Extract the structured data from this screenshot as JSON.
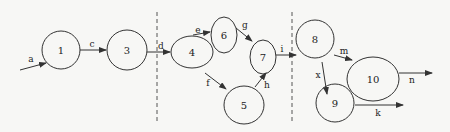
{
  "diagram": {
    "type": "directed-graph",
    "colors": {
      "stroke": "#333333",
      "background": "#f7f7f5",
      "text": "#222222"
    },
    "dividers": [
      {
        "id": "divider-1",
        "x": 157,
        "y1": 12,
        "y2": 122
      },
      {
        "id": "divider-2",
        "x": 292,
        "y1": 12,
        "y2": 122
      }
    ],
    "nodes": [
      {
        "id": "1",
        "label": "1",
        "cx": 61,
        "cy": 50,
        "rx": 19,
        "ry": 19
      },
      {
        "id": "3",
        "label": "3",
        "cx": 127,
        "cy": 50,
        "rx": 20,
        "ry": 20
      },
      {
        "id": "4",
        "label": "4",
        "cx": 192,
        "cy": 52,
        "rx": 21,
        "ry": 16
      },
      {
        "id": "6",
        "label": "6",
        "cx": 224,
        "cy": 35,
        "rx": 13,
        "ry": 18
      },
      {
        "id": "7",
        "label": "7",
        "cx": 263,
        "cy": 57,
        "rx": 13,
        "ry": 17
      },
      {
        "id": "5",
        "label": "5",
        "cx": 244,
        "cy": 105,
        "rx": 20,
        "ry": 19
      },
      {
        "id": "8",
        "label": "8",
        "cx": 315,
        "cy": 39,
        "rx": 19,
        "ry": 19
      },
      {
        "id": "10",
        "label": "10",
        "cx": 373,
        "cy": 79,
        "rx": 26,
        "ry": 22
      },
      {
        "id": "9",
        "label": "9",
        "cx": 335,
        "cy": 103,
        "rx": 19,
        "ry": 19
      }
    ],
    "edges": [
      {
        "id": "a",
        "label": "a",
        "from": "start",
        "to": "1",
        "x1": 20,
        "y1": 70,
        "x2": 46,
        "y2": 63,
        "lx": 31,
        "ly": 59
      },
      {
        "id": "c",
        "label": "c",
        "from": "1",
        "to": "3",
        "x1": 80,
        "y1": 50,
        "x2": 106,
        "y2": 50,
        "lx": 92,
        "ly": 44
      },
      {
        "id": "d",
        "label": "d",
        "from": "3",
        "to": "4",
        "x1": 147,
        "y1": 52,
        "x2": 170,
        "y2": 52,
        "lx": 161,
        "ly": 46
      },
      {
        "id": "e",
        "label": "e",
        "from": "4",
        "to": "6",
        "x1": 193,
        "y1": 35,
        "x2": 210,
        "y2": 32,
        "lx": 198,
        "ly": 30
      },
      {
        "id": "g",
        "label": "g",
        "from": "6",
        "to": "7",
        "x1": 236,
        "y1": 28,
        "x2": 252,
        "y2": 41,
        "lx": 245,
        "ly": 25
      },
      {
        "id": "f",
        "label": "f",
        "from": "4",
        "to": "5",
        "x1": 205,
        "y1": 73,
        "x2": 226,
        "y2": 89,
        "lx": 208,
        "ly": 83
      },
      {
        "id": "h",
        "label": "h",
        "from": "5",
        "to": "7",
        "x1": 255,
        "y1": 87,
        "x2": 266,
        "y2": 73,
        "lx": 267,
        "ly": 85
      },
      {
        "id": "i",
        "label": "i",
        "from": "7",
        "to": "8",
        "x1": 276,
        "y1": 55,
        "x2": 296,
        "y2": 55,
        "lx": 282,
        "ly": 49
      },
      {
        "id": "m",
        "label": "m",
        "from": "8",
        "to": "10",
        "x1": 334,
        "y1": 55,
        "x2": 352,
        "y2": 60,
        "lx": 344,
        "ly": 51
      },
      {
        "id": "x",
        "label": "x",
        "from": "8",
        "to": "9",
        "x1": 322,
        "y1": 62,
        "x2": 327,
        "y2": 94,
        "lx": 318,
        "ly": 75
      },
      {
        "id": "n",
        "label": "n",
        "from": "10",
        "to": "out",
        "x1": 399,
        "y1": 73,
        "x2": 432,
        "y2": 73,
        "lx": 412,
        "ly": 80
      },
      {
        "id": "k",
        "label": "k",
        "from": "9",
        "to": "out",
        "x1": 355,
        "y1": 105,
        "x2": 403,
        "y2": 105,
        "lx": 378,
        "ly": 113
      }
    ]
  }
}
